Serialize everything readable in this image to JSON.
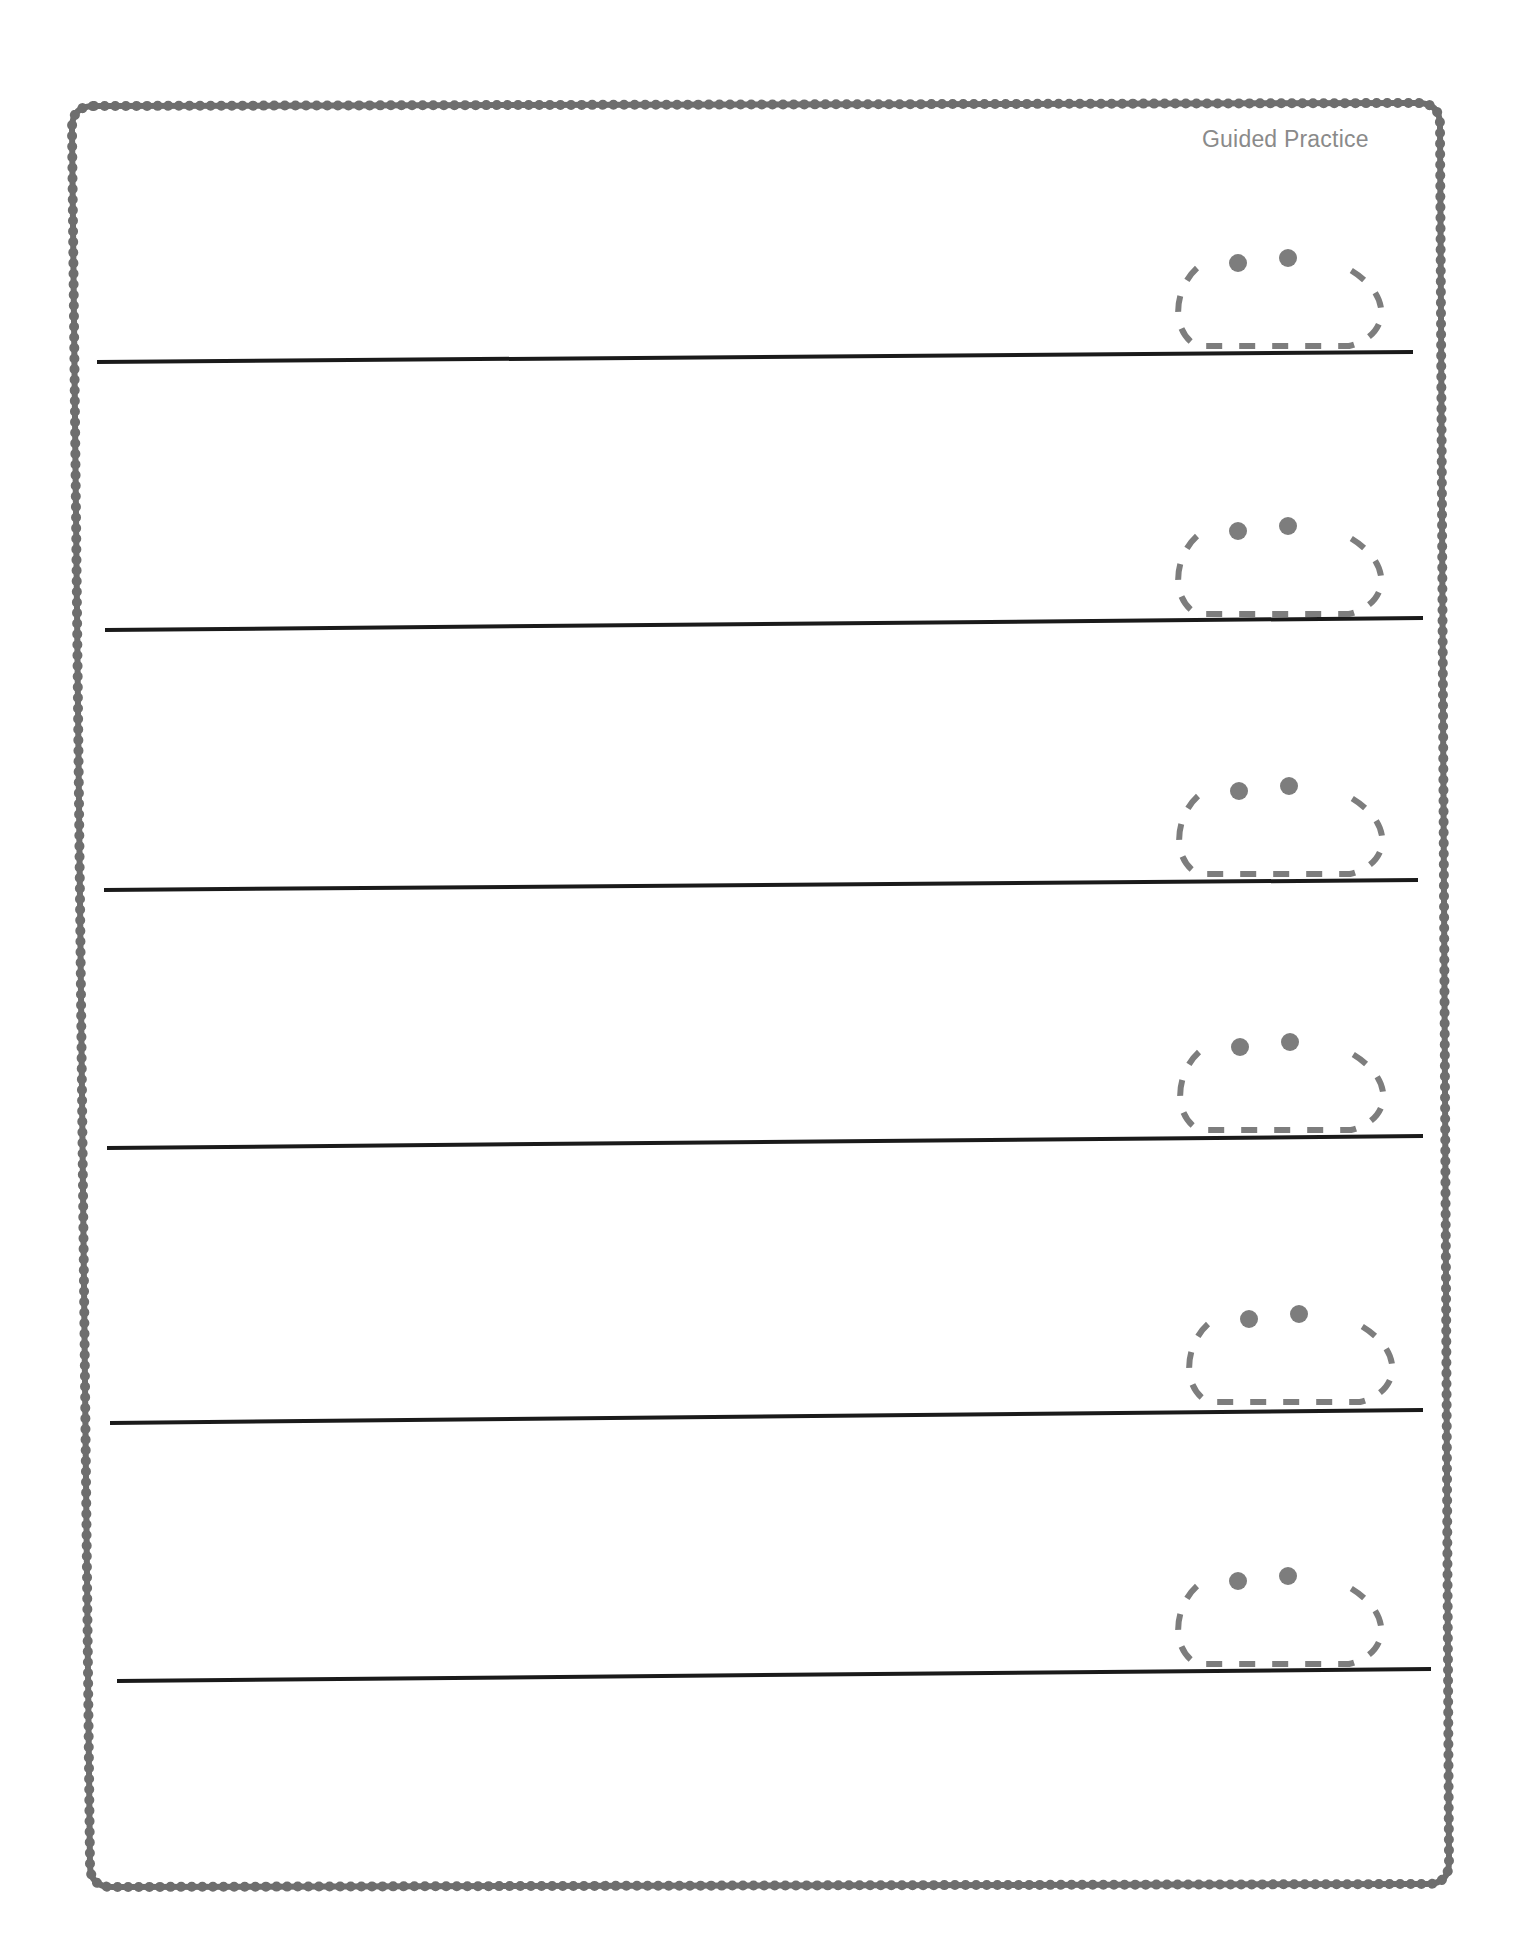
{
  "page": {
    "header_label": "Guided Practice",
    "colors": {
      "border": "#6e6e6e",
      "writing_line": "#1a1a1a",
      "trace_guide": "#7d7d7d",
      "header_text": "#8a8a8a"
    }
  },
  "frame": {
    "corners": {
      "tl": [
        72,
        106
      ],
      "tr": [
        1440,
        103
      ],
      "br": [
        1449,
        1884
      ],
      "bl": [
        90,
        1887
      ]
    },
    "radius": 22
  },
  "writing_lines": [
    {
      "x1": 97,
      "y1": 362,
      "x2": 1413,
      "y2": 352
    },
    {
      "x1": 105,
      "y1": 630,
      "x2": 1423,
      "y2": 618
    },
    {
      "x1": 104,
      "y1": 890,
      "x2": 1418,
      "y2": 880
    },
    {
      "x1": 107,
      "y1": 1148,
      "x2": 1423,
      "y2": 1136
    },
    {
      "x1": 110,
      "y1": 1423,
      "x2": 1423,
      "y2": 1410
    },
    {
      "x1": 117,
      "y1": 1681,
      "x2": 1431,
      "y2": 1669
    }
  ],
  "trace_letters": [
    {
      "glyph": "ä",
      "x": 1167,
      "y": 256
    },
    {
      "glyph": "ä",
      "x": 1167,
      "y": 524
    },
    {
      "glyph": "ä",
      "x": 1168,
      "y": 784
    },
    {
      "glyph": "ä",
      "x": 1169,
      "y": 1040
    },
    {
      "glyph": "ä",
      "x": 1178,
      "y": 1312
    },
    {
      "glyph": "ä",
      "x": 1167,
      "y": 1574
    }
  ]
}
